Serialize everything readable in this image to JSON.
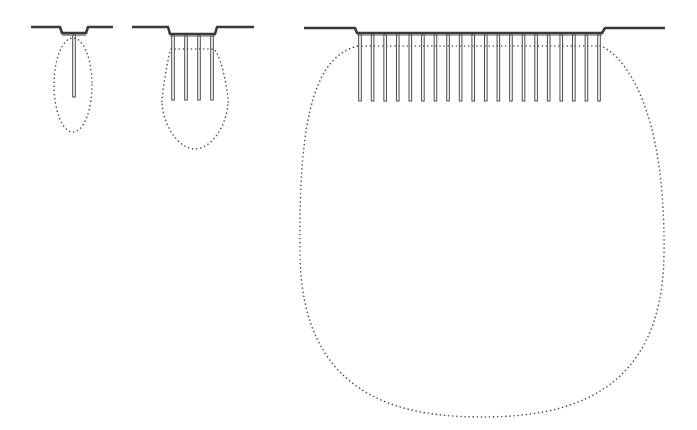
{
  "diagram": {
    "type": "pile-group-pressure-bulbs",
    "colors": {
      "background": "#ffffff",
      "ground_line": "#3a3a3a",
      "pile": "#4a4a4a",
      "pile_cap": "#5a5a5a",
      "bulb_dots": "#555555"
    },
    "groups": [
      {
        "id": "single-pile",
        "pile_count": 1,
        "ground_left": [
          31,
          60
        ],
        "ground_right": [
          88,
          113
        ],
        "cap": {
          "x1": 62,
          "x2": 86,
          "y": 33
        },
        "ground_y": 27,
        "pile_bottom_y": 97,
        "bulb": {
          "cx": 73,
          "cy": 85,
          "rx": 19,
          "ry": 47
        }
      },
      {
        "id": "small-pile-group",
        "pile_count": 4,
        "ground_left": [
          132,
          168
        ],
        "ground_right": [
          217,
          254
        ],
        "cap": {
          "x1": 170,
          "x2": 215,
          "y": 34
        },
        "ground_y": 27,
        "pile_bottom_y": 100,
        "bulb": {
          "cx": 195,
          "cy": 93,
          "rx": 33,
          "ry": 56
        }
      },
      {
        "id": "large-pile-group",
        "pile_count": 20,
        "ground_left": [
          304,
          355
        ],
        "ground_right": [
          605,
          665
        ],
        "cap": {
          "x1": 357,
          "x2": 602,
          "y": 33
        },
        "ground_y": 28,
        "pile_bottom_y": 101,
        "bulb": {
          "cx": 482,
          "cy": 225,
          "rx": 182,
          "ry": 192
        }
      }
    ]
  }
}
